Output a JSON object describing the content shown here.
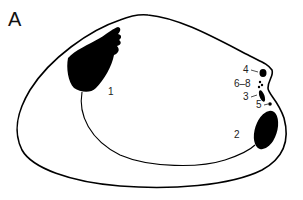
{
  "figure": {
    "panel_label": "A",
    "labels": [
      {
        "id": "1",
        "text": "1",
        "x": 110,
        "y": 95
      },
      {
        "id": "2",
        "text": "2",
        "x": 236,
        "y": 138
      },
      {
        "id": "3",
        "text": "3",
        "x": 244,
        "y": 100
      },
      {
        "id": "4",
        "text": "4",
        "x": 244,
        "y": 73
      },
      {
        "id": "5",
        "text": "5",
        "x": 257,
        "y": 108
      },
      {
        "id": "6-8",
        "text": "6–8",
        "x": 236,
        "y": 87
      }
    ],
    "colors": {
      "ink": "#000000",
      "background": "#ffffff"
    }
  }
}
